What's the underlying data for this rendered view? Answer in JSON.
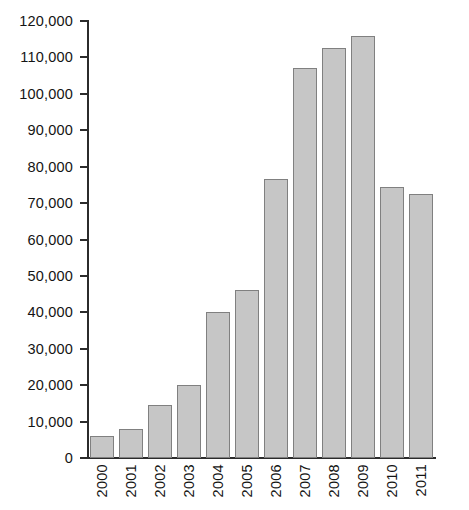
{
  "chart_data": {
    "type": "bar",
    "title": "",
    "subtitle": "",
    "xlabel": "",
    "ylabel": "",
    "categories": [
      "2000",
      "2001",
      "2002",
      "2003",
      "2004",
      "2005",
      "2006",
      "2007",
      "2008",
      "2009",
      "2010",
      "2011"
    ],
    "values": [
      6000,
      8000,
      14500,
      20000,
      40000,
      46000,
      76500,
      107000,
      112500,
      116000,
      74500,
      72500
    ],
    "ylim": [
      0,
      120000
    ],
    "ytick_values": [
      0,
      10000,
      20000,
      30000,
      40000,
      50000,
      60000,
      70000,
      80000,
      90000,
      100000,
      110000,
      120000
    ],
    "ytick_labels": [
      "0",
      "10,000",
      "20,000",
      "30,000",
      "40,000",
      "50,000",
      "60,000",
      "70,000",
      "80,000",
      "90,000",
      "100,000",
      "110,000",
      "120,000"
    ],
    "grid": false,
    "legend": null,
    "legend_position": "none",
    "annotations": [],
    "bar_fill_color": "#c6c6c6",
    "bar_border_color": "#808080",
    "axis_color": "#2b2b2b",
    "background_color": "#ffffff",
    "x_tick_label_rotation": 90
  }
}
